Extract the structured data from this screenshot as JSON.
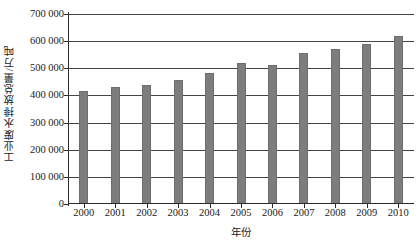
{
  "chart_data": {
    "type": "bar",
    "title": "",
    "xlabel": "年份",
    "ylabel": "工业废水排放总量/万吨",
    "categories": [
      "2000",
      "2001",
      "2002",
      "2003",
      "2004",
      "2005",
      "2006",
      "2007",
      "2008",
      "2009",
      "2010"
    ],
    "values": [
      415000,
      430000,
      437000,
      456000,
      482000,
      521000,
      512000,
      557000,
      572000,
      589000,
      620000
    ],
    "ylim": [
      0,
      700000
    ],
    "ytick_values": [
      0,
      100000,
      200000,
      300000,
      400000,
      500000,
      600000,
      700000
    ],
    "ytick_labels": [
      "0",
      "100 000",
      "200 000",
      "300 000",
      "400 000",
      "500 000",
      "600 000",
      "700 000"
    ],
    "grid": true,
    "legend": false,
    "series_color": "#7d7d7d",
    "axis_color": "#2b2b2b",
    "grid_color": "#444444",
    "background_color": "#ffffff"
  }
}
